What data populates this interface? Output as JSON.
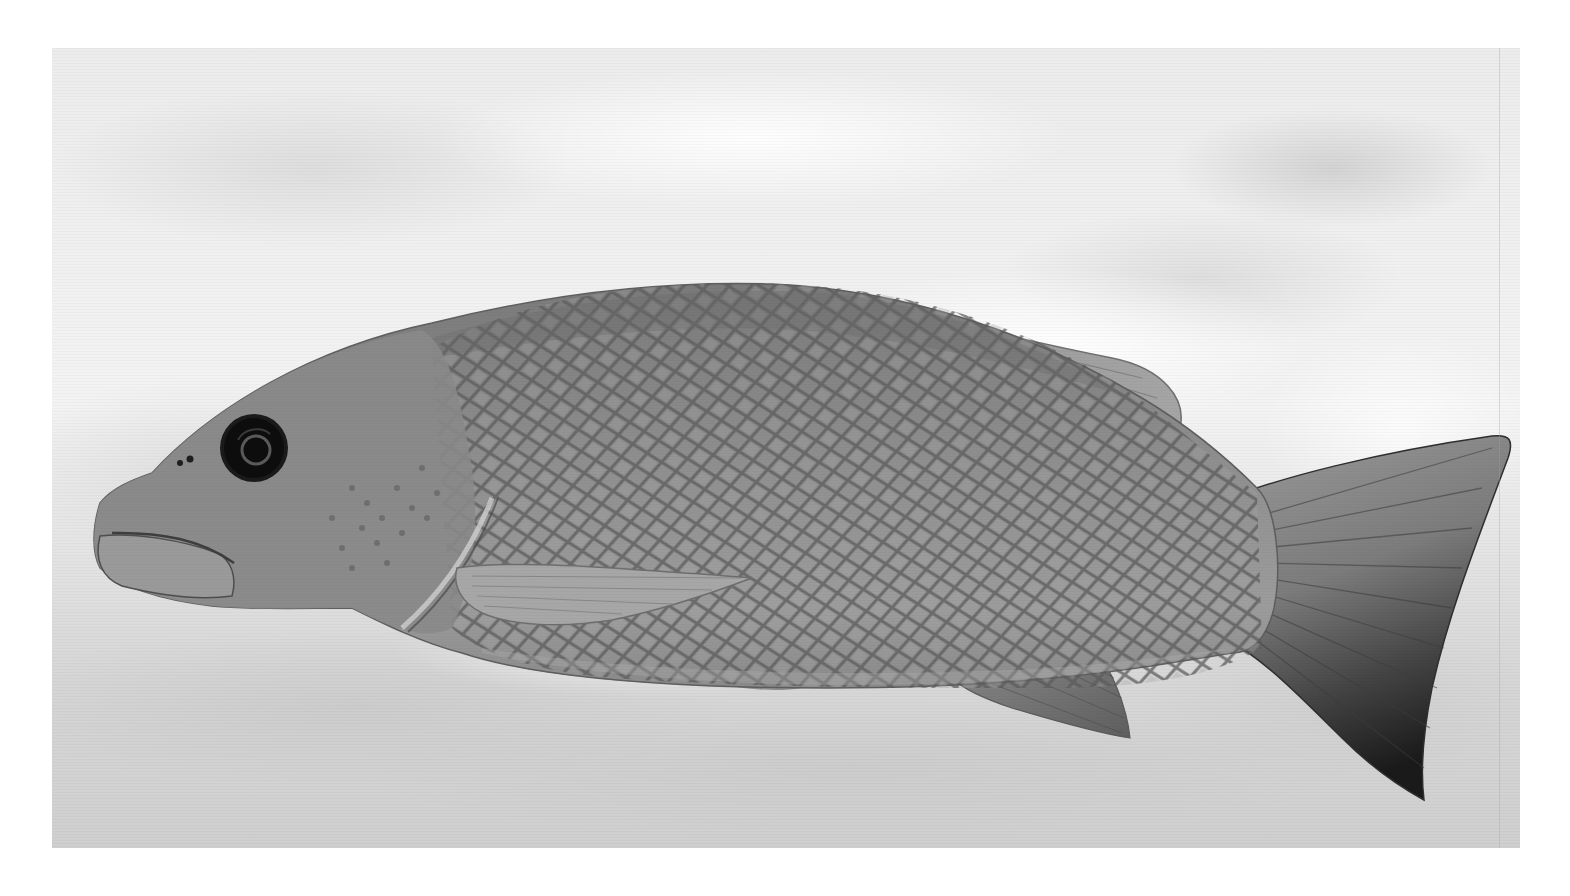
{
  "image": {
    "subject": "fish",
    "description": "Grayscale photograph of a snapper-like fish swimming to the left, showing reticulated scale pattern, dorsal, pectoral, anal and forked caudal fins, against a blurred light water background",
    "orientation": "facing-left",
    "palette": {
      "background_light": "#f2f2f2",
      "background_mid": "#d6d6d6",
      "background_dark": "#bdbdbd",
      "body": "#8c8c8c",
      "body_shadow": "#6a6a6a",
      "scale_mesh": "#5a5a5a",
      "fin": "#9a9a9a",
      "tail_dark": "#2a2a2a",
      "eye": "#111111",
      "border": "#ffffff"
    }
  }
}
